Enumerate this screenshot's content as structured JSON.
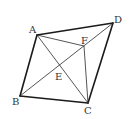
{
  "diagram": {
    "type": "geometry-figure",
    "points": {
      "A": {
        "label": "A"
      },
      "B": {
        "label": "B"
      },
      "C": {
        "label": "C"
      },
      "D": {
        "label": "D"
      },
      "E": {
        "label": "E"
      },
      "F": {
        "label": "F"
      }
    },
    "outline_segments": [
      [
        "A",
        "D"
      ],
      [
        "D",
        "C"
      ],
      [
        "C",
        "B"
      ],
      [
        "B",
        "A"
      ]
    ],
    "inner_segments": [
      [
        "A",
        "C"
      ],
      [
        "B",
        "D"
      ],
      [
        "A",
        "F"
      ],
      [
        "F",
        "C"
      ]
    ],
    "colors": {
      "line": "#1a1a1a",
      "label": "#333333",
      "background": "#ffffff"
    }
  }
}
